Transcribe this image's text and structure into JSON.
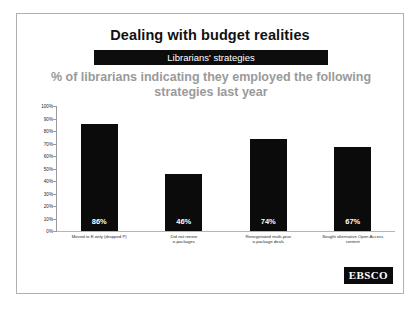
{
  "page": {
    "top_strip_left": "",
    "top_strip_right": ""
  },
  "slide": {
    "title": "Dealing with budget realities",
    "band_label": "Librarians' strategies",
    "subtitle": "% of librarians indicating they employed the\nfollowing strategies last year",
    "logo": "EBSCO",
    "colors": {
      "bar": "#0b0b0b",
      "band": "#0d0d0d",
      "subtitle": "#9a9a9a",
      "title": "#111111",
      "frame": "#b0b0b0"
    }
  },
  "chart_data": {
    "type": "bar",
    "title": "% of librarians indicating they employed the following strategies last year",
    "subtitle": "Librarians' strategies",
    "xlabel": "",
    "ylabel": "",
    "ylim": [
      0,
      100
    ],
    "grid": false,
    "legend": null,
    "categories": [
      "Moved to E-only (dropped P)",
      "Did not renew\ne-packages",
      "Renegotiated multi-year\ne-package deals",
      "Sought alternative Open Access\ncontent"
    ],
    "values": [
      86,
      46,
      74,
      67
    ],
    "data_labels": [
      "86%",
      "46%",
      "74%",
      "67%"
    ],
    "ytick_labels": [
      "100%",
      "90%",
      "80%",
      "70%",
      "60%",
      "50%",
      "40%",
      "30%",
      "20%",
      "10%",
      "0%"
    ],
    "ytick_values": [
      100,
      90,
      80,
      70,
      60,
      50,
      40,
      30,
      20,
      10,
      0
    ]
  }
}
